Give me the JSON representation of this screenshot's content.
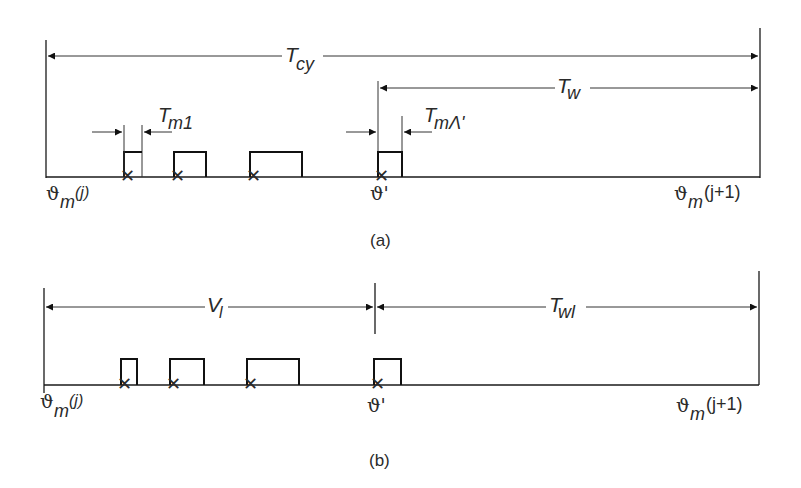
{
  "diagram_a": {
    "caption": "(a)",
    "span_cycle": {
      "label_main": "T",
      "label_sub": "cy"
    },
    "span_wait": {
      "label_main": "T",
      "label_sub": "w"
    },
    "span_first_job": {
      "label_main": "T",
      "label_sub": "m1"
    },
    "span_new_job": {
      "label_main": "T",
      "label_sub": "mΛ'"
    },
    "start_label": {
      "symbol": "ϑ",
      "sub": "m",
      "arg": "(j)"
    },
    "arrival_label": {
      "symbol": "ϑ'"
    },
    "end_label": {
      "symbol": "ϑ",
      "sub": "m",
      "arg": "(j+1)"
    }
  },
  "diagram_b": {
    "caption": "(b)",
    "span_vacation": {
      "label_main": "V",
      "label_sub": "l"
    },
    "span_wait": {
      "label_main": "T",
      "label_sub": "wl"
    },
    "start_label": {
      "symbol": "ϑ",
      "sub": "m",
      "arg": "(j)"
    },
    "arrival_label": {
      "symbol": "ϑ'"
    },
    "end_label": {
      "symbol": "ϑ",
      "sub": "m",
      "arg": "(j+1)"
    }
  }
}
